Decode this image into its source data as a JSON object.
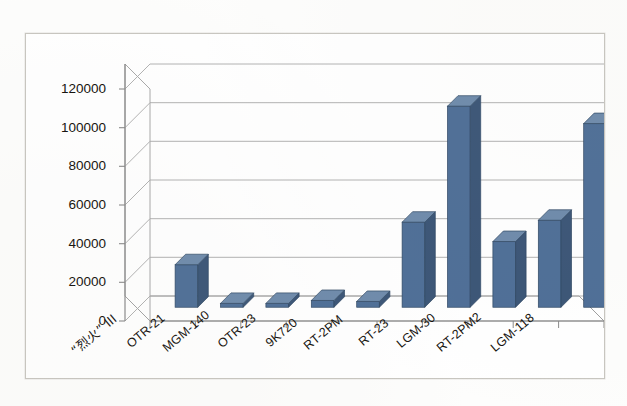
{
  "figure": {
    "background_color": "#ffffff",
    "frame_color": "#c8c6c0"
  },
  "chart_data": {
    "type": "bar",
    "title": "",
    "subtitle": "",
    "xlabel": "",
    "ylabel": "",
    "categories": [
      "“烈火” III",
      "OTR-21",
      "MGM-140",
      "OTR-23",
      "9K720",
      "RT-2PM",
      "RT-23",
      "LGM-30",
      "RT-2PM2",
      "LGM-118"
    ],
    "values": [
      22000,
      2000,
      2000,
      3500,
      3000,
      44000,
      104000,
      34000,
      45000,
      95000
    ],
    "series": [
      {
        "name": "系列1",
        "values": [
          22000,
          2000,
          2000,
          3500,
          3000,
          44000,
          104000,
          34000,
          45000,
          95000
        ]
      }
    ],
    "ylim": [
      0,
      120000
    ],
    "yticks": [
      0,
      20000,
      40000,
      60000,
      80000,
      100000,
      120000
    ],
    "ytick_labels": [
      "0",
      "20000",
      "40000",
      "60000",
      "80000",
      "100000",
      "120000"
    ],
    "grid": true,
    "grid_axis": "y",
    "legend": false,
    "legend_position": "none",
    "three_d": true,
    "bar_color": "#4f6f97",
    "bar_side_color": "#3c5677",
    "bar_top_color": "#6f8bab",
    "bar_edge_color": "#2f4763",
    "gridline_color": "#a9a9a9",
    "axis_color": "#808080",
    "tick_label_color": "#15120d"
  }
}
